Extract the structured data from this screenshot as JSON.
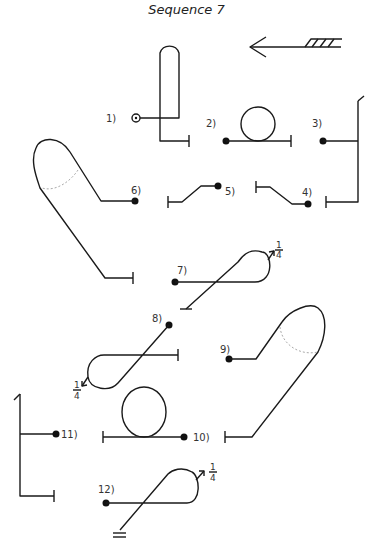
{
  "title": "Sequence 7",
  "steps": [
    {
      "id": 1,
      "label": "1)"
    },
    {
      "id": 2,
      "label": "2)"
    },
    {
      "id": 3,
      "label": "3)"
    },
    {
      "id": 4,
      "label": "4)"
    },
    {
      "id": 5,
      "label": "5)"
    },
    {
      "id": 6,
      "label": "6)"
    },
    {
      "id": 7,
      "label": "7)"
    },
    {
      "id": 8,
      "label": "8)"
    },
    {
      "id": 9,
      "label": "9)"
    },
    {
      "id": 10,
      "label": "10)"
    },
    {
      "id": 11,
      "label": "11)"
    },
    {
      "id": 12,
      "label": "12)"
    }
  ],
  "rotations": {
    "step7": {
      "num": "1",
      "den": "4"
    },
    "step8": {
      "num": "1",
      "den": "4"
    },
    "step12": {
      "num": "1",
      "den": "4"
    }
  },
  "direction_indicator": "left-arrow-with-hatched-tail",
  "colors": {
    "stroke": "#1a1a1a",
    "background": "#ffffff"
  }
}
